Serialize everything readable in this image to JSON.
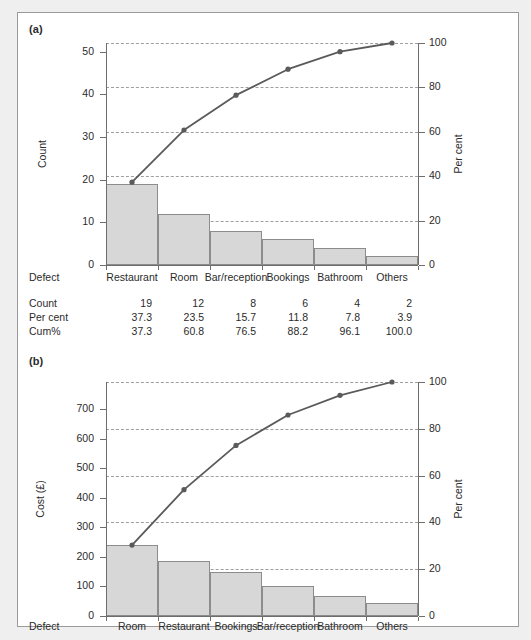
{
  "figure": {
    "panel_a_label": "(a)",
    "panel_b_label": "(b)"
  },
  "chart_data": [
    {
      "id": "pareto-count",
      "type": "bar",
      "panel": "(a)",
      "title": "",
      "xlabel": "Defect",
      "ylabel": "Count",
      "y2label": "Per cent",
      "categories": [
        "Restaurant",
        "Room",
        "Bar/reception",
        "Bookings",
        "Bathroom",
        "Others"
      ],
      "values": [
        19,
        12,
        8,
        6,
        4,
        2
      ],
      "percent": [
        37.3,
        23.5,
        15.7,
        11.8,
        7.8,
        3.9
      ],
      "cumulative_percent": [
        37.3,
        60.8,
        76.5,
        88.2,
        96.1,
        100.0
      ],
      "ylim": [
        0,
        52
      ],
      "yticks": [
        0,
        10,
        20,
        30,
        40,
        50
      ],
      "y2lim": [
        0,
        100
      ],
      "y2ticks": [
        0,
        20,
        40,
        60,
        80,
        100
      ],
      "grid": true,
      "legend": "none",
      "table_rows": [
        {
          "label": "Defect",
          "values": [
            "Restaurant",
            "Room",
            "Bar/reception",
            "Bookings",
            "Bathroom",
            "Others"
          ]
        },
        {
          "label": "Count",
          "values": [
            "19",
            "12",
            "8",
            "6",
            "4",
            "2"
          ]
        },
        {
          "label": "Per cent",
          "values": [
            "37.3",
            "23.5",
            "15.7",
            "11.8",
            "7.8",
            "3.9"
          ]
        },
        {
          "label": "Cum%",
          "values": [
            "37.3",
            "60.8",
            "76.5",
            "88.2",
            "96.1",
            "100.0"
          ]
        }
      ]
    },
    {
      "id": "pareto-cost",
      "type": "bar",
      "panel": "(b)",
      "title": "",
      "xlabel": "Defect",
      "ylabel": "Cost (£)",
      "y2label": "Per cent",
      "categories": [
        "Room",
        "Restaurant",
        "Bookings",
        "Bar/reception",
        "Bathroom",
        "Others"
      ],
      "values": [
        240,
        188,
        150,
        103,
        67,
        45
      ],
      "cumulative_percent": [
        30.3,
        54.0,
        72.9,
        85.9,
        94.3,
        100.0
      ],
      "ylim": [
        0,
        793
      ],
      "yticks": [
        0,
        100,
        200,
        300,
        400,
        500,
        600,
        700
      ],
      "y2lim": [
        0,
        100
      ],
      "y2ticks": [
        0,
        20,
        40,
        60,
        80,
        100
      ],
      "grid": true,
      "legend": "none"
    }
  ],
  "colors": {
    "bar_fill": "#d7d7d7",
    "bar_edge": "#8c8c8c",
    "line": "#5a5a5a",
    "axis": "#6d6d6d",
    "grid": "#9e9e9e",
    "frame": "#9a9a9a",
    "text": "#231f20",
    "page_background": "#efefef",
    "panel_background": "#ffffff"
  }
}
